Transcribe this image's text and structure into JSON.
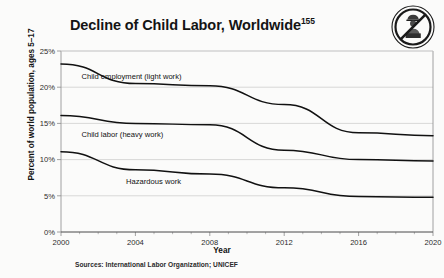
{
  "figure": {
    "title_text": "Decline of Child Labor, Worldwide",
    "title_superscript": "155",
    "source_note": "Sources: International Labor Organization; UNICEF",
    "icon_name": "no-child-labor-icon",
    "background_color": "#fbfbfa",
    "line_color": "#111111",
    "grid_color": "#c9c9c9",
    "axis_color": "#8a8a8a"
  },
  "chart_data": {
    "type": "line",
    "title": "Decline of Child Labor, Worldwide",
    "xlabel": "Year",
    "ylabel": "Percent of world population, ages 5–17",
    "x": [
      2000,
      2004,
      2008,
      2012,
      2016,
      2020
    ],
    "xlim": [
      2000,
      2020
    ],
    "ylim": [
      0,
      25
    ],
    "xticks": [
      2000,
      2004,
      2008,
      2012,
      2016,
      2020
    ],
    "xtick_labels": [
      "2000",
      "2004",
      "2008",
      "2012",
      "2016",
      "2020"
    ],
    "yticks": [
      0,
      5,
      10,
      15,
      20,
      25
    ],
    "ytick_labels": [
      "0%",
      "5%",
      "10%",
      "15%",
      "20%",
      "25%"
    ],
    "grid": "horizontal",
    "legend": "inline-labels",
    "minor_xticks": true,
    "series": [
      {
        "name": "Child employment (light work)",
        "label_x": 2001.1,
        "label_y": 21.2,
        "values": [
          23.2,
          20.5,
          20.2,
          17.6,
          13.7,
          13.3
        ]
      },
      {
        "name": "Child labor (heavy work)",
        "label_x": 2001.1,
        "label_y": 13.1,
        "values": [
          16.1,
          15.0,
          14.8,
          11.3,
          10.0,
          9.8
        ]
      },
      {
        "name": "Hazardous work",
        "label_x": 2003.5,
        "label_y": 6.6,
        "values": [
          11.1,
          8.6,
          8.0,
          6.1,
          4.9,
          4.8
        ]
      }
    ]
  }
}
